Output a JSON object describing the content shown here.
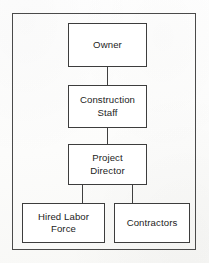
{
  "diagram": {
    "type": "organization-chart",
    "orientation": "top-down",
    "colors": {
      "box_border": "#3d3d3d",
      "frame_border": "#4a4a4a",
      "text": "#232323",
      "connector": "#3f3f3f",
      "background": "#fdfdfc"
    },
    "nodes": [
      {
        "id": "owner",
        "label": "Owner",
        "level": 1
      },
      {
        "id": "construction-staff",
        "label": "Construction\nStaff",
        "level": 2
      },
      {
        "id": "project-director",
        "label": "Project\nDirector",
        "level": 3
      },
      {
        "id": "hired-labor-force",
        "label": "Hired Labor\nForce",
        "level": 4
      },
      {
        "id": "contractors",
        "label": "Contractors",
        "level": 4
      }
    ],
    "edges": [
      {
        "from": "owner",
        "to": "construction-staff"
      },
      {
        "from": "construction-staff",
        "to": "project-director"
      },
      {
        "from": "project-director",
        "to": "hired-labor-force"
      },
      {
        "from": "project-director",
        "to": "contractors"
      }
    ]
  }
}
